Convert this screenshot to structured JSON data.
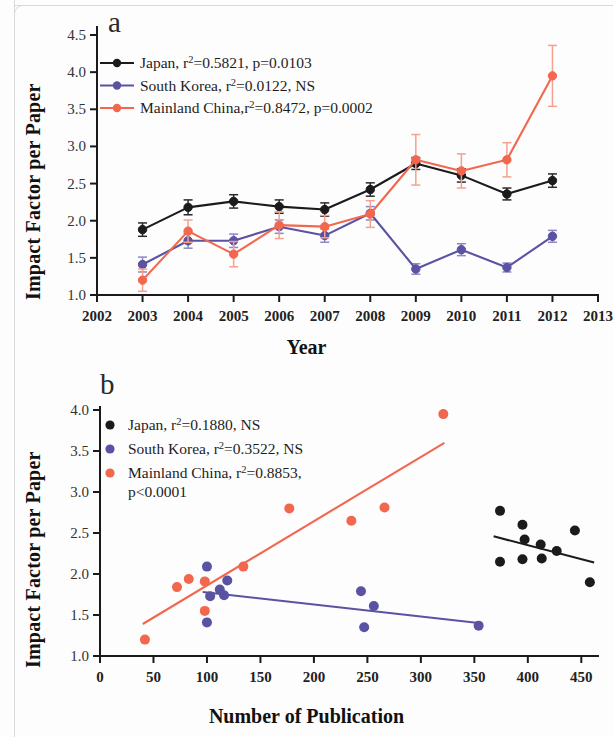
{
  "figure": {
    "panels": [
      {
        "id": "a",
        "label": "a",
        "ylabel": "Impact Factor per Paper",
        "xlabel": "Year"
      },
      {
        "id": "b",
        "label": "b",
        "ylabel": "Impact Factor per Paper",
        "xlabel": "Number of Publication"
      }
    ]
  },
  "colors": {
    "japan": "#1b1b1b",
    "south_korea": "#5a52a3",
    "mainland_china": "#f2674e",
    "axis": "#1a1a1a"
  },
  "chart_data": [
    {
      "type": "line",
      "panel": "a",
      "title": "a",
      "xlabel": "Year",
      "ylabel": "Impact Factor per Paper",
      "xlim": [
        2002,
        2013
      ],
      "ylim": [
        1.0,
        4.5
      ],
      "xticks": [
        2002,
        2003,
        2004,
        2005,
        2006,
        2007,
        2008,
        2009,
        2010,
        2011,
        2012,
        2013
      ],
      "xticklabels": [
        "2002",
        "2003",
        "2004",
        "2005",
        "2006",
        "2007",
        "2008",
        "2009",
        "2010",
        "2011",
        "2012",
        "2013"
      ],
      "yticks": [
        1.0,
        1.5,
        2.0,
        2.5,
        3.0,
        3.5,
        4.0,
        4.5
      ],
      "yticklabels": [
        "1.0",
        "1.5",
        "2.0",
        "2.5",
        "3.0",
        "3.5",
        "4.0",
        "4.5"
      ],
      "grid": false,
      "legend_position": "upper-left",
      "error_bars": true,
      "x": [
        2003,
        2004,
        2005,
        2006,
        2007,
        2008,
        2009,
        2010,
        2011,
        2012
      ],
      "series": [
        {
          "name": "Japan",
          "legend": "Japan, r2=0.5821, p=0.0103",
          "legend_prefix": "Japan, r",
          "legend_sup": "2",
          "legend_suffix": "=0.5821, p=0.0103",
          "r2": 0.5821,
          "p": "0.0103",
          "color": "#1b1b1b",
          "values": [
            1.88,
            2.18,
            2.26,
            2.19,
            2.15,
            2.42,
            2.77,
            2.61,
            2.36,
            2.54
          ],
          "errors": [
            0.09,
            0.1,
            0.09,
            0.09,
            0.09,
            0.09,
            0.08,
            0.09,
            0.08,
            0.09
          ]
        },
        {
          "name": "South Korea",
          "legend": "South Korea, r2=0.0122, NS",
          "legend_prefix": "South Korea, r",
          "legend_sup": "2",
          "legend_suffix": "=0.0122, NS",
          "r2": 0.0122,
          "p": "NS",
          "color": "#5a52a3",
          "values": [
            1.41,
            1.73,
            1.73,
            1.92,
            1.8,
            2.1,
            1.35,
            1.61,
            1.37,
            1.79
          ],
          "errors": [
            0.1,
            0.1,
            0.09,
            0.09,
            0.09,
            0.09,
            0.07,
            0.08,
            0.06,
            0.08
          ]
        },
        {
          "name": "Mainland China",
          "legend": "Mainland China,r2=0.8472, p=0.0002",
          "legend_prefix": "Mainland China,r",
          "legend_sup": "2",
          "legend_suffix": "=0.8472, p=0.0002",
          "r2": 0.8472,
          "p": "0.0002",
          "color": "#f2674e",
          "values": [
            1.2,
            1.86,
            1.55,
            1.94,
            1.92,
            2.09,
            2.82,
            2.67,
            2.82,
            3.95
          ],
          "errors": [
            0.15,
            0.15,
            0.17,
            0.18,
            0.15,
            0.18,
            0.34,
            0.23,
            0.23,
            0.41
          ]
        }
      ]
    },
    {
      "type": "scatter",
      "panel": "b",
      "title": "b",
      "xlabel": "Number of Publication",
      "ylabel": "Impact Factor per Paper",
      "xlim": [
        0,
        460
      ],
      "ylim": [
        1.0,
        4.0
      ],
      "xticks": [
        0,
        50,
        100,
        150,
        200,
        250,
        300,
        350,
        400,
        450
      ],
      "xticklabels": [
        "0",
        "50",
        "100",
        "150",
        "200",
        "250",
        "300",
        "350",
        "400",
        "450"
      ],
      "yticks": [
        1.0,
        1.5,
        2.0,
        2.5,
        3.0,
        3.5,
        4.0
      ],
      "yticklabels": [
        "1.0",
        "1.5",
        "2.0",
        "2.5",
        "3.0",
        "3.5",
        "4.0"
      ],
      "grid": false,
      "legend_position": "upper-left",
      "series": [
        {
          "name": "Japan",
          "legend": "Japan, r2=0.1880, NS",
          "legend_prefix": "Japan, r",
          "legend_sup": "2",
          "legend_suffix": "=0.1880, NS",
          "r2": 0.188,
          "p": "NS",
          "color": "#1b1b1b",
          "points": [
            [
              374,
              2.77
            ],
            [
              374,
              2.15
            ],
            [
              395,
              2.6
            ],
            [
              395,
              2.18
            ],
            [
              397,
              2.42
            ],
            [
              412,
              2.36
            ],
            [
              413,
              2.19
            ],
            [
              427,
              2.28
            ],
            [
              444,
              2.53
            ],
            [
              458,
              1.9
            ]
          ],
          "fit": [
            [
              368,
              2.46
            ],
            [
              462,
              2.14
            ]
          ]
        },
        {
          "name": "South Korea",
          "legend": "South Korea, r2=0.3522, NS",
          "legend_prefix": "South Korea, r",
          "legend_sup": "2",
          "legend_suffix": "=0.3522, NS",
          "r2": 0.3522,
          "p": "NS",
          "color": "#5a52a3",
          "points": [
            [
              100,
              2.09
            ],
            [
              100,
              1.41
            ],
            [
              103,
              1.73
            ],
            [
              112,
              1.81
            ],
            [
              116,
              1.74
            ],
            [
              119,
              1.92
            ],
            [
              244,
              1.79
            ],
            [
              247,
              1.35
            ],
            [
              256,
              1.61
            ],
            [
              354,
              1.37
            ]
          ],
          "fit": [
            [
              96,
              1.78
            ],
            [
              356,
              1.4
            ]
          ]
        },
        {
          "name": "Mainland China",
          "legend": "Mainland China, r2=0.8853, p<0.0001",
          "legend_prefix": "Mainland China, r",
          "legend_sup": "2",
          "legend_suffix": "=0.8853,",
          "legend_line2": "p<0.0001",
          "r2": 0.8853,
          "p": "<0.0001",
          "color": "#f2674e",
          "points": [
            [
              42,
              1.2
            ],
            [
              72,
              1.84
            ],
            [
              83,
              1.94
            ],
            [
              98,
              1.91
            ],
            [
              98,
              1.55
            ],
            [
              134,
              2.09
            ],
            [
              177,
              2.8
            ],
            [
              235,
              2.65
            ],
            [
              266,
              2.81
            ],
            [
              321,
              3.95
            ]
          ],
          "fit": [
            [
              40,
              1.39
            ],
            [
              322,
              3.6
            ]
          ]
        }
      ]
    }
  ]
}
